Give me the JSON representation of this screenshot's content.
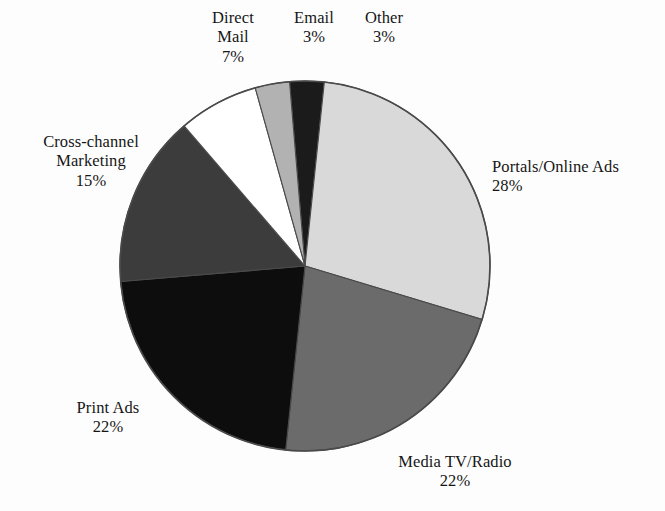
{
  "chart_data": {
    "type": "pie",
    "title": "",
    "subtitle": "",
    "xlabel": "",
    "ylabel": "",
    "legend_position": "none",
    "grid": false,
    "unit": "%",
    "start_angle_deg": -94.8,
    "direction": "clockwise",
    "center": {
      "x": 305,
      "y": 266
    },
    "radius": 185,
    "categories": [
      "Other",
      "Portals/Online Ads",
      "Media TV/Radio",
      "Print Ads",
      "Cross-channel Marketing",
      "Direct Mail",
      "Email"
    ],
    "values": [
      3,
      28,
      22,
      22,
      15,
      7,
      3
    ],
    "slices": [
      {
        "label": "Other",
        "value": 3,
        "value_text": "3%",
        "color": "#1b1b1b"
      },
      {
        "label": "Portals/Online Ads",
        "value": 28,
        "value_text": "28%",
        "color": "#d9d9d9"
      },
      {
        "label": "Media TV/Radio",
        "value": 22,
        "value_text": "22%",
        "color": "#6b6b6b"
      },
      {
        "label": "Print Ads",
        "value": 22,
        "value_text": "22%",
        "color": "#0d0d0d"
      },
      {
        "label": "Cross-channel Marketing",
        "value": 15,
        "value_text": "15%",
        "color": "#3c3c3c"
      },
      {
        "label": "Direct Mail",
        "value": 7,
        "value_text": "7%",
        "color": "#ffffff"
      },
      {
        "label": "Email",
        "value": 3,
        "value_text": "3%",
        "color": "#b2b2b2"
      }
    ]
  },
  "labels": {
    "direct_mail": {
      "line1": "Direct",
      "line2": "Mail",
      "value": "7%"
    },
    "email": {
      "line1": "Email",
      "line2": "",
      "value": "3%"
    },
    "other": {
      "line1": "Other",
      "line2": "",
      "value": "3%"
    },
    "portals": {
      "line1": "Portals/Online Ads",
      "line2": "",
      "value": "28%"
    },
    "cross": {
      "line1": "Cross-channel",
      "line2": "Marketing",
      "value": "15%"
    },
    "print": {
      "line1": "Print Ads",
      "line2": "",
      "value": "22%"
    },
    "media": {
      "line1": "Media TV/Radio",
      "line2": "",
      "value": "22%"
    }
  },
  "style": {
    "outline_color": "#4a4a4a",
    "background": "#fdfdfd",
    "text_color": "#161616"
  }
}
